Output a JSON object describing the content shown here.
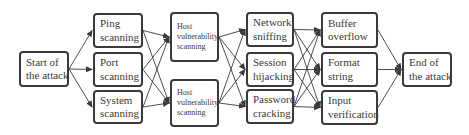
{
  "diagram": {
    "type": "flowchart",
    "direction": "left-to-right",
    "nodes": [
      {
        "id": "start",
        "lines": [
          "Start of",
          "the attack"
        ],
        "x": 19,
        "y": 51,
        "w": 50,
        "h": 36,
        "small": false
      },
      {
        "id": "ping",
        "lines": [
          "Ping",
          "scanning"
        ],
        "x": 93,
        "y": 13,
        "w": 50,
        "h": 35,
        "small": false
      },
      {
        "id": "port",
        "lines": [
          "Port",
          "scanning"
        ],
        "x": 93,
        "y": 52,
        "w": 50,
        "h": 35,
        "small": false
      },
      {
        "id": "system",
        "lines": [
          "System",
          "scanning"
        ],
        "x": 93,
        "y": 90,
        "w": 50,
        "h": 34,
        "small": false
      },
      {
        "id": "host1",
        "lines": [
          "Host",
          "vulnerability",
          "scanning"
        ],
        "x": 170,
        "y": 12,
        "w": 49,
        "h": 50,
        "small": true
      },
      {
        "id": "host2",
        "lines": [
          "Host",
          "vulnerability",
          "scanning"
        ],
        "x": 170,
        "y": 79,
        "w": 49,
        "h": 48,
        "small": true
      },
      {
        "id": "network",
        "lines": [
          "Network",
          "sniffing"
        ],
        "x": 246,
        "y": 12,
        "w": 48,
        "h": 35,
        "small": false
      },
      {
        "id": "session",
        "lines": [
          "Session",
          "hijacking"
        ],
        "x": 246,
        "y": 52,
        "w": 48,
        "h": 35,
        "small": false
      },
      {
        "id": "password",
        "lines": [
          "Password",
          "cracking"
        ],
        "x": 246,
        "y": 89,
        "w": 48,
        "h": 35,
        "small": false
      },
      {
        "id": "buffer",
        "lines": [
          "Buffer",
          "overflow"
        ],
        "x": 321,
        "y": 12,
        "w": 57,
        "h": 36,
        "small": false
      },
      {
        "id": "format",
        "lines": [
          "Format",
          "string"
        ],
        "x": 321,
        "y": 52,
        "w": 57,
        "h": 35,
        "small": false
      },
      {
        "id": "input",
        "lines": [
          "Input",
          "verification"
        ],
        "x": 321,
        "y": 90,
        "w": 57,
        "h": 35,
        "small": false
      },
      {
        "id": "end",
        "lines": [
          "End of",
          "the attack"
        ],
        "x": 402,
        "y": 52,
        "w": 50,
        "h": 35,
        "small": false
      }
    ],
    "edges": [
      [
        "start",
        "ping"
      ],
      [
        "start",
        "port"
      ],
      [
        "start",
        "system"
      ],
      [
        "ping",
        "host1"
      ],
      [
        "ping",
        "host2"
      ],
      [
        "port",
        "host1"
      ],
      [
        "port",
        "host2"
      ],
      [
        "system",
        "host1"
      ],
      [
        "system",
        "host2"
      ],
      [
        "host1",
        "network"
      ],
      [
        "host1",
        "session"
      ],
      [
        "host1",
        "password"
      ],
      [
        "host2",
        "network"
      ],
      [
        "host2",
        "session"
      ],
      [
        "host2",
        "password"
      ],
      [
        "network",
        "buffer"
      ],
      [
        "network",
        "format"
      ],
      [
        "network",
        "input"
      ],
      [
        "session",
        "buffer"
      ],
      [
        "session",
        "format"
      ],
      [
        "session",
        "input"
      ],
      [
        "password",
        "buffer"
      ],
      [
        "password",
        "format"
      ],
      [
        "password",
        "input"
      ],
      [
        "buffer",
        "end"
      ],
      [
        "format",
        "end"
      ],
      [
        "input",
        "end"
      ]
    ],
    "colors": {
      "stroke": "#3a3a3a",
      "text": "#3a3a3a",
      "background": "#ffffff"
    }
  }
}
